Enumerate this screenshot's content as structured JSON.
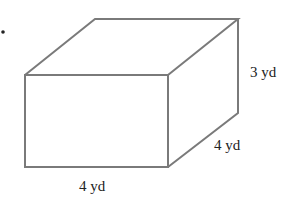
{
  "figure": {
    "type": "rectangular prism",
    "bullet": "•",
    "labels": {
      "height": "3 yd",
      "depth": "4 yd",
      "width": "4 yd"
    },
    "colors": {
      "edge": "#7a7a7a",
      "text": "#222222",
      "background": "#ffffff"
    }
  }
}
